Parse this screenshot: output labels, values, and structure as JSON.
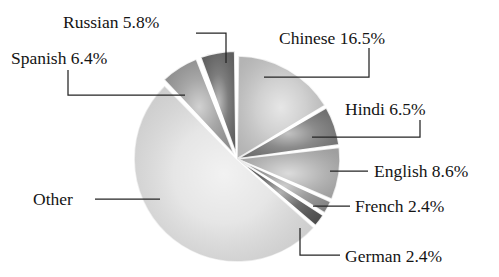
{
  "chart_data": {
    "type": "pie",
    "title": "",
    "subtitle": "",
    "xlabel": "",
    "ylabel": "",
    "legend_position": "none",
    "grid": false,
    "units": "percent",
    "start_angle_deg": 0,
    "direction": "clockwise",
    "categories": [
      "Chinese",
      "Hindi",
      "English",
      "French",
      "German",
      "Other",
      "Spanish",
      "Russian"
    ],
    "values": [
      16.5,
      6.5,
      8.6,
      2.4,
      2.4,
      51.4,
      6.4,
      5.8
    ],
    "slices": [
      {
        "name": "Chinese",
        "label": "Chinese 16.5%",
        "value": 16.5,
        "value_text": "16.5%",
        "color": "#c8c8c8",
        "exploded": false,
        "label_x": 279,
        "label_y": 44,
        "leader": "M 369,48 L 369,77 L 264,77"
      },
      {
        "name": "Hindi",
        "label": "Hindi 6.5%",
        "value": 6.5,
        "value_text": "6.5%",
        "color": "#787878",
        "exploded": false,
        "label_x": 345,
        "label_y": 115,
        "leader": "M 420,120 L 420,137 L 312,137"
      },
      {
        "name": "English",
        "label": "English 8.6%",
        "value": 8.6,
        "value_text": "8.6%",
        "color": "#b0b0b0",
        "exploded": false,
        "label_x": 374,
        "label_y": 177,
        "leader": "M 330,171 L 368,171"
      },
      {
        "name": "French",
        "label": "French 2.4%",
        "value": 2.4,
        "value_text": "2.4%",
        "color": "#909090",
        "exploded": false,
        "label_x": 355,
        "label_y": 212,
        "leader": "M 313,206 L 350,206"
      },
      {
        "name": "German",
        "label": "German 2.4%",
        "value": 2.4,
        "value_text": "2.4%",
        "color": "#555555",
        "exploded": false,
        "label_x": 345,
        "label_y": 262,
        "leader": "M 300,228 L 300,255 L 340,255"
      },
      {
        "name": "Other",
        "label": "Other",
        "value": 51.4,
        "value_text": "",
        "color": "#e2e2e2",
        "exploded": false,
        "label_x": 33,
        "label_y": 205,
        "leader": "M 95,199 L 160,199"
      },
      {
        "name": "Spanish",
        "label": "Spanish 6.4%",
        "value": 6.4,
        "value_text": "6.4%",
        "color": "#9a9a9a",
        "exploded": true,
        "label_x": 11,
        "label_y": 64,
        "leader": "M 68,70 L 68,95 L 185,95"
      },
      {
        "name": "Russian",
        "label": "Russian 5.8%",
        "value": 5.8,
        "value_text": "5.8%",
        "color": "#686868",
        "exploded": true,
        "label_x": 63,
        "label_y": 28,
        "leader": "M 196,33 L 226,33 L 226,63"
      }
    ]
  },
  "geometry": {
    "center_x": 237,
    "center_y": 159,
    "radius": 103,
    "gap_deg": 1.6,
    "explode_offset": 5
  },
  "colors": {
    "background": "#ffffff",
    "text": "#141414",
    "leader_line": "#242424",
    "slice_separator": "#ffffff"
  }
}
